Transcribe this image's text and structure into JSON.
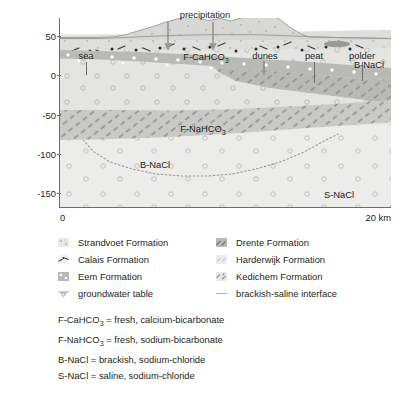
{
  "figure": {
    "yaxis": {
      "title": "elevation in m below sea level",
      "ticks": [
        "50",
        "0",
        "-50",
        "-100",
        "-150"
      ],
      "values": [
        50,
        0,
        -50,
        -100,
        -150
      ],
      "range": [
        -180,
        62
      ]
    },
    "xaxis": {
      "left_label": "0",
      "right_label": "20 km",
      "range_km": [
        0,
        20
      ]
    },
    "surface_annotations": [
      {
        "label": "sea",
        "x_km": 1.6
      },
      {
        "label": "precipitation",
        "x_km": 8.1
      },
      {
        "label": "dunes",
        "x_km": 13.6
      },
      {
        "label": "peat",
        "x_km": 17.0
      },
      {
        "label": "polder",
        "x_km": 19.0
      }
    ],
    "unit_labels": [
      {
        "label": "F-CaHCO3",
        "html": "F-CaHCO<sub>3</sub>",
        "x_km": 8.8,
        "y_m": -22
      },
      {
        "label": "F-NaHCO3",
        "html": "F-NaHCO<sub>3</sub>",
        "x_km": 8.6,
        "y_m": -93
      },
      {
        "label": "B-NaCl",
        "html": "B-NaCl",
        "x_km": 18.6,
        "y_m": -28
      },
      {
        "label": "B-NaCl",
        "html": "B-NaCl",
        "x_km": 5.7,
        "y_m": -118
      },
      {
        "label": "S-NaCl",
        "html": "S-NaCl",
        "x_km": 16.8,
        "y_m": -165
      }
    ]
  },
  "chart_data": {
    "type": "area",
    "xlabel": "distance (km)",
    "ylabel": "elevation in m below sea level",
    "xlim": [
      0,
      20
    ],
    "ylim": [
      -180,
      62
    ],
    "grid": false,
    "legend_position": "below-axes",
    "annotations": [
      "sea",
      "precipitation",
      "dunes",
      "peat",
      "polder",
      "F-CaHCO3",
      "F-NaHCO3",
      "B-NaCl",
      "B-NaCl",
      "S-NaCl"
    ],
    "series": [
      {
        "name": "land surface / dune topography",
        "x": [
          0,
          2.0,
          3.2,
          4.0,
          5.0,
          5.8,
          6.4,
          7.2,
          7.8,
          8.3,
          8.9,
          9.6,
          10.3,
          11.0,
          11.6,
          12.2,
          12.8,
          13.4,
          13.9,
          14.4,
          15.0,
          17.0,
          20.0
        ],
        "y": [
          -1,
          -1,
          -0.5,
          2,
          8,
          14,
          19,
          24,
          27,
          24,
          22,
          24,
          21,
          26,
          31,
          33,
          30,
          22,
          12,
          4,
          0,
          -1,
          -2
        ]
      },
      {
        "name": "base of Calais Formation (top of shallow sandy aquifer)",
        "x": [
          0,
          4,
          8,
          12,
          16,
          20
        ],
        "y": [
          -2,
          -1,
          0,
          -1,
          -3,
          -6
        ]
      },
      {
        "name": "top of Drente Formation (clay band)",
        "x": [
          0,
          3,
          6,
          9,
          11,
          12.5,
          14,
          16,
          18,
          20
        ],
        "y": [
          -26,
          -27,
          -29,
          -31,
          -32,
          -33,
          -26,
          -24,
          -23,
          -24
        ]
      },
      {
        "name": "base of Drente Formation (clay band)",
        "x": [
          0,
          3,
          6,
          9,
          11,
          12.5,
          14,
          16,
          18,
          20
        ],
        "y": [
          -38,
          -39,
          -41,
          -43,
          -44,
          -45,
          -46,
          -48,
          -50,
          -53
        ]
      },
      {
        "name": "top of deep Drente/Kedichem clay band",
        "x": [
          0,
          4,
          8,
          12,
          16,
          20
        ],
        "y": [
          -100,
          -100,
          -101,
          -99,
          -95,
          -90
        ]
      },
      {
        "name": "base of deep clay band",
        "x": [
          0,
          4,
          8,
          12,
          16,
          20
        ],
        "y": [
          -134,
          -133,
          -131,
          -127,
          -122,
          -117
        ]
      },
      {
        "name": "brackish-saline interface",
        "x": [
          1.4,
          2.2,
          3.2,
          4.5,
          6.0,
          7.5,
          9.0,
          10.5,
          12.0,
          13.5,
          15.0,
          16.2,
          17.0
        ],
        "y": [
          -131,
          -142,
          -152,
          -159,
          -164,
          -166,
          -166,
          -164,
          -160,
          -153,
          -142,
          -131,
          -123
        ]
      },
      {
        "name": "brackish wedge upper boundary (polder side)",
        "x": [
          12.6,
          14.0,
          16.0,
          18.0,
          20.0
        ],
        "y": [
          -33,
          -26,
          -24,
          -23,
          -24
        ]
      },
      {
        "name": "brackish wedge lower boundary (polder side)",
        "x": [
          12.6,
          14.0,
          16.0,
          18.0,
          20.0
        ],
        "y": [
          -45,
          -52,
          -58,
          -62,
          -66
        ]
      }
    ],
    "water_quality_zones": [
      {
        "code": "F-CaHCO3",
        "description": "fresh, calcium-bicarbonate"
      },
      {
        "code": "F-NaHCO3",
        "description": "fresh, sodium-bicarbonate"
      },
      {
        "code": "B-NaCl",
        "description": "brackish, sodium-chloride"
      },
      {
        "code": "S-NaCl",
        "description": "saline, sodium-chloride"
      }
    ]
  },
  "legend": {
    "columns": [
      {
        "items": [
          {
            "label": "Strandvoet Formation",
            "swatch": "strandvoet-swatch"
          },
          {
            "label": "Calais Formation",
            "swatch": "calais-swatch"
          },
          {
            "label": "Eem Formation",
            "swatch": "eem-swatch"
          },
          {
            "label": "groundwater table",
            "swatch": "groundwater-table-swatch"
          }
        ]
      },
      {
        "items": [
          {
            "label": "Drente Formation",
            "swatch": "drente-swatch"
          },
          {
            "label": "Harderwijk Formation",
            "swatch": "harderwijk-swatch"
          },
          {
            "label": "Kedichem Formation",
            "swatch": "kedichem-swatch"
          },
          {
            "label": "brackish-saline interface",
            "swatch": "interface-line-swatch"
          }
        ]
      }
    ]
  },
  "abbreviations": [
    {
      "code": "F-CaHCO3",
      "html": "F-CaHCO<sub>3</sub> = fresh, calcium-bicarbonate"
    },
    {
      "code": "F-NaHCO3",
      "html": "F-NaHCO<sub>3</sub> = fresh, sodium-bicarbonate"
    },
    {
      "code": "B-NaCl",
      "html": "B-NaCl = brackish, sodium-chloride"
    },
    {
      "code": "S-NaCl",
      "html": "S-NaCl = saline, sodium-chloride"
    }
  ],
  "colors": {
    "background": "#ffffff",
    "text": "#231f20",
    "axis": "#6d6d6d",
    "strandvoet": "#e9e9e7",
    "calais": "#dededa",
    "eem": "#e4e4e1",
    "drente": "#b9bab5",
    "harderwijk": "#ececea",
    "kedichem": "#d0d1cd",
    "dune": "#d7d8d3",
    "peat": "#9a9b96",
    "interface": "#9a9b96"
  }
}
